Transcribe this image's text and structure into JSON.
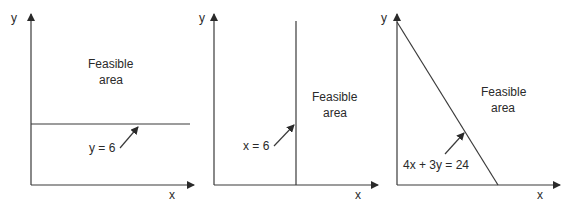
{
  "panels": [
    {
      "id": "panel-1",
      "x_axis_label": "x",
      "y_axis_label": "y",
      "feasible_line1": "Feasible",
      "feasible_line2": "area",
      "constraint_label": "y = 6",
      "constraint_type": "horizontal"
    },
    {
      "id": "panel-2",
      "x_axis_label": "x",
      "y_axis_label": "y",
      "feasible_line1": "Feasible",
      "feasible_line2": "area",
      "constraint_label": "x = 6",
      "constraint_type": "vertical"
    },
    {
      "id": "panel-3",
      "x_axis_label": "x",
      "y_axis_label": "y",
      "feasible_line1": "Feasible",
      "feasible_line2": "area",
      "constraint_label": "4x + 3y = 24",
      "constraint_type": "diagonal"
    }
  ],
  "colors": {
    "line": "#3a3a3a",
    "text": "#2a2a2a",
    "background": "#ffffff"
  }
}
